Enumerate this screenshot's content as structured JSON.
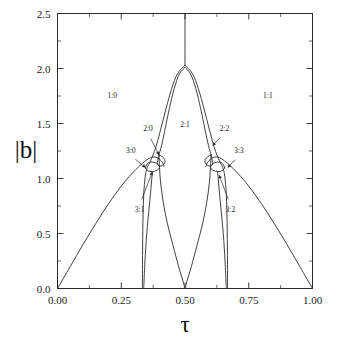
{
  "chart_data": {
    "type": "line",
    "title": "",
    "xlabel": "τ",
    "ylabel": "|b|",
    "xlim": [
      0.0,
      1.0
    ],
    "ylim": [
      0.0,
      2.5
    ],
    "grid": false,
    "legend": "none",
    "xticks": [
      "0.00",
      "0.25",
      "0.50",
      "0.75",
      "1.00"
    ],
    "xtick_values": [
      0.0,
      0.25,
      0.5,
      0.75,
      1.0
    ],
    "yticks": [
      "0.0",
      "0.5",
      "1.0",
      "1.5",
      "2.0",
      "2.5"
    ],
    "ytick_values": [
      0.0,
      0.5,
      1.0,
      1.5,
      2.0,
      2.5
    ],
    "minor_xticks": [
      0.125,
      0.375,
      0.625,
      0.875
    ],
    "minor_yticks": [
      0.25,
      0.75,
      1.25,
      1.75,
      2.25
    ],
    "region_labels": [
      {
        "text": "1:0",
        "x": 0.215,
        "y": 1.73
      },
      {
        "text": "2:1",
        "x": 0.5,
        "y": 1.47
      },
      {
        "text": "1:1",
        "x": 0.825,
        "y": 1.73
      }
    ],
    "callouts": [
      {
        "text": "2:0",
        "label_x": 0.355,
        "label_y": 1.41,
        "tip_x": 0.398,
        "tip_y": 1.215
      },
      {
        "text": "3:0",
        "label_x": 0.287,
        "label_y": 1.21,
        "tip_x": 0.345,
        "tip_y": 1.1
      },
      {
        "text": "3:1",
        "label_x": 0.322,
        "label_y": 0.76,
        "tip_x": 0.372,
        "tip_y": 1.06
      },
      {
        "text": "2:2",
        "label_x": 0.655,
        "label_y": 1.41,
        "tip_x": 0.608,
        "tip_y": 1.3
      },
      {
        "text": "3:3",
        "label_x": 0.712,
        "label_y": 1.21,
        "tip_x": 0.668,
        "tip_y": 1.1
      },
      {
        "text": "3:2",
        "label_x": 0.678,
        "label_y": 0.76,
        "tip_x": 0.634,
        "tip_y": 1.03
      }
    ],
    "series": [
      {
        "name": "1:0 boundary (left main arc)",
        "comment": "rises from (0.00, 0.00) to peak near (0.37, 1.20) then down into the 3:0 node",
        "points": [
          [
            0.0,
            0.0
          ],
          [
            0.05,
            0.2
          ],
          [
            0.1,
            0.4
          ],
          [
            0.15,
            0.59
          ],
          [
            0.2,
            0.77
          ],
          [
            0.25,
            0.93
          ],
          [
            0.29,
            1.04
          ],
          [
            0.32,
            1.11
          ],
          [
            0.345,
            1.16
          ],
          [
            0.365,
            1.19
          ],
          [
            0.385,
            1.195
          ],
          [
            0.4,
            1.175
          ],
          [
            0.412,
            1.145
          ],
          [
            0.418,
            1.11
          ]
        ]
      },
      {
        "name": "1:1 boundary (right main arc)",
        "comment": "mirror of the left main arc about tau = 0.5",
        "points": [
          [
            1.0,
            0.0
          ],
          [
            0.95,
            0.2
          ],
          [
            0.9,
            0.4
          ],
          [
            0.85,
            0.59
          ],
          [
            0.8,
            0.77
          ],
          [
            0.75,
            0.93
          ],
          [
            0.71,
            1.04
          ],
          [
            0.68,
            1.11
          ],
          [
            0.655,
            1.16
          ],
          [
            0.635,
            1.19
          ],
          [
            0.615,
            1.195
          ],
          [
            0.6,
            1.175
          ],
          [
            0.588,
            1.145
          ],
          [
            0.582,
            1.11
          ]
        ]
      },
      {
        "name": "2:1 tongue left branch",
        "comment": "from (0.333, 0.00) up to apex (0.50, 2.03)",
        "points": [
          [
            0.333,
            0.0
          ],
          [
            0.3335,
            0.3
          ],
          [
            0.335,
            0.6
          ],
          [
            0.338,
            0.85
          ],
          [
            0.344,
            1.02
          ],
          [
            0.352,
            1.1
          ],
          [
            0.365,
            1.16
          ],
          [
            0.385,
            1.28
          ],
          [
            0.405,
            1.45
          ],
          [
            0.425,
            1.63
          ],
          [
            0.448,
            1.82
          ],
          [
            0.47,
            1.95
          ],
          [
            0.5,
            2.03
          ]
        ]
      },
      {
        "name": "2:1 tongue right branch",
        "comment": "from (0.667, 0.00) up to apex (0.50, 2.03)",
        "points": [
          [
            0.667,
            0.0
          ],
          [
            0.6665,
            0.3
          ],
          [
            0.665,
            0.6
          ],
          [
            0.662,
            0.85
          ],
          [
            0.656,
            1.02
          ],
          [
            0.648,
            1.1
          ],
          [
            0.635,
            1.16
          ],
          [
            0.615,
            1.28
          ],
          [
            0.595,
            1.45
          ],
          [
            0.575,
            1.63
          ],
          [
            0.552,
            1.82
          ],
          [
            0.53,
            1.95
          ],
          [
            0.5,
            2.03
          ]
        ]
      },
      {
        "name": "2:1 inner left branch",
        "comment": "inner companion curve starting at the 2:0 node",
        "points": [
          [
            0.398,
            1.215
          ],
          [
            0.408,
            1.3
          ],
          [
            0.422,
            1.45
          ],
          [
            0.438,
            1.63
          ],
          [
            0.458,
            1.82
          ],
          [
            0.478,
            1.95
          ],
          [
            0.5,
            2.01
          ]
        ]
      },
      {
        "name": "2:1 inner right branch",
        "points": [
          [
            0.602,
            1.215
          ],
          [
            0.592,
            1.3
          ],
          [
            0.578,
            1.45
          ],
          [
            0.562,
            1.63
          ],
          [
            0.542,
            1.82
          ],
          [
            0.522,
            1.95
          ],
          [
            0.5,
            2.01
          ]
        ]
      },
      {
        "name": "central descending branch left",
        "comment": "falls from the 2:0 node down to zero at tau = 0.50",
        "points": [
          [
            0.398,
            1.215
          ],
          [
            0.4,
            1.1
          ],
          [
            0.405,
            0.95
          ],
          [
            0.415,
            0.78
          ],
          [
            0.43,
            0.6
          ],
          [
            0.452,
            0.4
          ],
          [
            0.475,
            0.2
          ],
          [
            0.493,
            0.06
          ],
          [
            0.499,
            0.0
          ]
        ]
      },
      {
        "name": "central descending branch right",
        "points": [
          [
            0.602,
            1.215
          ],
          [
            0.6,
            1.1
          ],
          [
            0.595,
            0.95
          ],
          [
            0.585,
            0.78
          ],
          [
            0.57,
            0.6
          ],
          [
            0.548,
            0.4
          ],
          [
            0.525,
            0.2
          ],
          [
            0.507,
            0.06
          ],
          [
            0.501,
            0.0
          ]
        ]
      },
      {
        "name": "3:0 / 3:1 lobe (left)",
        "comment": "small closed lobe around (0.36, 1.10)",
        "points": [
          [
            0.345,
            1.1
          ],
          [
            0.352,
            1.135
          ],
          [
            0.365,
            1.15
          ],
          [
            0.382,
            1.145
          ],
          [
            0.395,
            1.125
          ],
          [
            0.4,
            1.1
          ],
          [
            0.39,
            1.075
          ],
          [
            0.372,
            1.063
          ],
          [
            0.356,
            1.07
          ],
          [
            0.346,
            1.088
          ],
          [
            0.345,
            1.1
          ]
        ]
      },
      {
        "name": "3:3 / 3:2 lobe (right)",
        "points": [
          [
            0.655,
            1.1
          ],
          [
            0.648,
            1.135
          ],
          [
            0.635,
            1.15
          ],
          [
            0.618,
            1.145
          ],
          [
            0.605,
            1.125
          ],
          [
            0.6,
            1.1
          ],
          [
            0.61,
            1.075
          ],
          [
            0.628,
            1.063
          ],
          [
            0.644,
            1.07
          ],
          [
            0.654,
            1.088
          ],
          [
            0.655,
            1.1
          ]
        ]
      },
      {
        "name": "2:0 small loop (left)",
        "comment": "tiny loop to the right of the 2:0 node near (0.41, 1.16)",
        "points": [
          [
            0.398,
            1.215
          ],
          [
            0.41,
            1.2
          ],
          [
            0.42,
            1.175
          ],
          [
            0.421,
            1.145
          ],
          [
            0.412,
            1.12
          ],
          [
            0.4,
            1.112
          ],
          [
            0.392,
            1.13
          ],
          [
            0.393,
            1.165
          ],
          [
            0.398,
            1.215
          ]
        ]
      },
      {
        "name": "2:2 small loop (right)",
        "points": [
          [
            0.602,
            1.215
          ],
          [
            0.59,
            1.2
          ],
          [
            0.58,
            1.175
          ],
          [
            0.579,
            1.145
          ],
          [
            0.588,
            1.12
          ],
          [
            0.6,
            1.112
          ],
          [
            0.608,
            1.13
          ],
          [
            0.607,
            1.165
          ],
          [
            0.602,
            1.215
          ]
        ]
      },
      {
        "name": "vertical line at tau = 0.5",
        "comment": "drops from the top frame (|b| = 2.5) to the 2:1 apex (|b| = 2.03)",
        "points": [
          [
            0.5,
            2.5
          ],
          [
            0.5,
            2.03
          ]
        ]
      },
      {
        "name": "3:1 lower tail left",
        "comment": "from the lobe down toward the 2:1 left branch near zero",
        "points": [
          [
            0.372,
            1.063
          ],
          [
            0.368,
            0.95
          ],
          [
            0.36,
            0.75
          ],
          [
            0.35,
            0.5
          ],
          [
            0.343,
            0.25
          ],
          [
            0.339,
            0.05
          ],
          [
            0.338,
            0.0
          ]
        ]
      },
      {
        "name": "3:2 lower tail right",
        "points": [
          [
            0.628,
            1.063
          ],
          [
            0.632,
            0.95
          ],
          [
            0.64,
            0.75
          ],
          [
            0.65,
            0.5
          ],
          [
            0.657,
            0.25
          ],
          [
            0.661,
            0.05
          ],
          [
            0.662,
            0.0
          ]
        ]
      }
    ]
  },
  "axis": {
    "y_title": "|b|",
    "x_title": "τ"
  }
}
